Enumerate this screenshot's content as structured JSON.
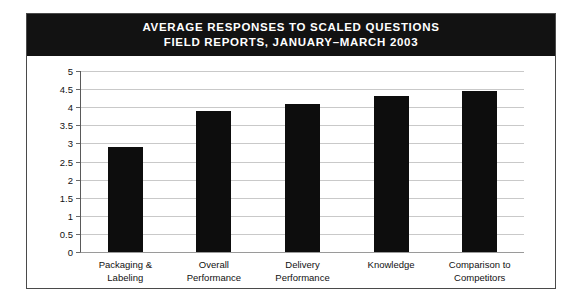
{
  "figure": {
    "title_line_1": "AVERAGE RESPONSES TO SCALED QUESTIONS",
    "title_line_2": "FIELD REPORTS, JANUARY–MARCH 2003",
    "banner_color": "#121212",
    "bar_color": "#0d0d0d",
    "background_color": "#ffffff",
    "border_color": "#4a4a4a",
    "gridline_color": "#c9c9c9"
  },
  "chart_data": {
    "type": "bar",
    "title": "AVERAGE RESPONSES TO SCALED QUESTIONS FIELD REPORTS, JANUARY–MARCH 2003",
    "categories": [
      "Packaging &\nLabeling",
      "Overall\nPerformance",
      "Delivery\nPerformance",
      "Knowledge",
      "Comparison to\nCompetitors"
    ],
    "category_lines": [
      [
        "Packaging &",
        "Labeling"
      ],
      [
        "Overall",
        "Performance"
      ],
      [
        "Delivery",
        "Performance"
      ],
      [
        "Knowledge",
        ""
      ],
      [
        "Comparison to",
        "Competitors"
      ]
    ],
    "values": [
      2.9,
      3.9,
      4.1,
      4.3,
      4.45
    ],
    "xlabel": "",
    "ylabel": "",
    "ylim": [
      0,
      5
    ],
    "ytick_labels": [
      "5",
      "4.5",
      "4",
      "3.5",
      "3",
      "2.5",
      "2",
      "1.5",
      "1",
      "0.5",
      "0"
    ],
    "ytick_values": [
      5,
      4.5,
      4,
      3.5,
      3,
      2.5,
      2,
      1.5,
      1,
      0.5,
      0
    ],
    "grid": true,
    "legend": false
  }
}
